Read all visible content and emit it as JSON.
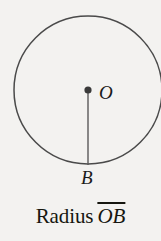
{
  "figure": {
    "type": "geometry-diagram",
    "background_color": "#f3f2f0",
    "stroke_color": "#4a4a4a",
    "text_color": "#16160f",
    "circle": {
      "center_x": 88,
      "center_y": 90,
      "radius": 74,
      "stroke_width": 1.5
    },
    "center_point": {
      "label": "O",
      "x": 88,
      "y": 90,
      "dot_radius": 3.6
    },
    "arc_point": {
      "label": "B",
      "x": 88,
      "y": 165
    },
    "radius_segment": {
      "from_x": 88,
      "from_y": 90,
      "to_x": 88,
      "to_y": 165,
      "stroke_width": 1.4
    }
  },
  "caption": {
    "word": "Radius",
    "segment": "OB",
    "segment_has_overline": true,
    "full_text": "Radius OB"
  }
}
